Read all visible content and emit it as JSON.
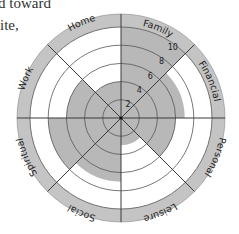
{
  "text_fragments": [
    "d toward",
    "ite,"
  ],
  "chart_data": {
    "type": "radar",
    "title": "",
    "categories": [
      "Family",
      "Financial",
      "Personal",
      "Leisure",
      "Social",
      "Spiritual",
      "Work",
      "Home"
    ],
    "series": [
      {
        "name": "Wheel of Life",
        "values": [
          10,
          7,
          6,
          3,
          7,
          8,
          6,
          4
        ]
      }
    ],
    "rlim": [
      0,
      10
    ],
    "ticks": [
      2,
      4,
      6,
      8,
      10
    ],
    "tick_labels": [
      "2",
      "4",
      "6",
      "8",
      "10"
    ],
    "grid": true,
    "colors": {
      "fill": "#b8b8b8",
      "band": "#c4c4c4",
      "line": "#3a3a3a",
      "grid": "#555555"
    }
  }
}
